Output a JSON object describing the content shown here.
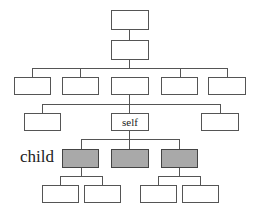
{
  "diagram": {
    "type": "hierarchy-tree",
    "labels": {
      "self": "self",
      "child_row": "child"
    },
    "colors": {
      "line": "#555555",
      "box_fill": "#ffffff",
      "child_fill": "#a9a9a9"
    },
    "levels": [
      {
        "name": "root",
        "count": 1
      },
      {
        "name": "parent",
        "count": 1
      },
      {
        "name": "level-3",
        "count": 5
      },
      {
        "name": "self-level",
        "count": 3,
        "labeled": "self"
      },
      {
        "name": "child",
        "count": 3,
        "shaded": true
      },
      {
        "name": "grandchild",
        "count": 4
      }
    ]
  }
}
